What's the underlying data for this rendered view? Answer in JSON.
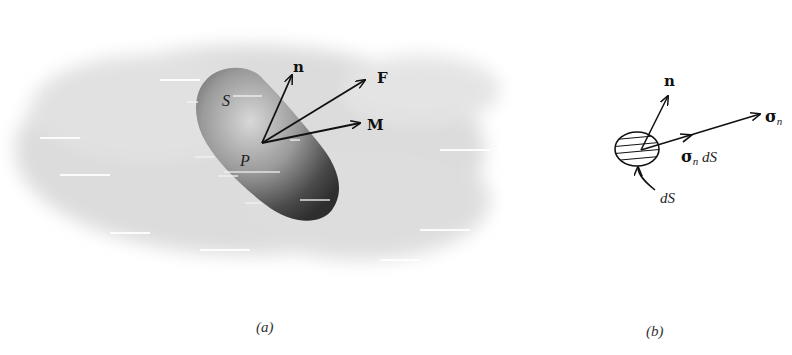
{
  "figure_a": {
    "caption": "(a)",
    "body_label": "S",
    "point_label": "P",
    "vectors": {
      "normal": "n",
      "force": "F",
      "moment": "M"
    }
  },
  "figure_b": {
    "caption": "(b)",
    "normal_label": "n",
    "stress_label": "σ",
    "stress_subscript": "n",
    "element_force_sigma": "σ",
    "element_force_sub": "n",
    "element_force_suffix": " dS",
    "area_label": "dS"
  },
  "colors": {
    "ink": "#111111",
    "shadow": "#d4d4d4",
    "body_dark": "#333333",
    "body_light": "#b8b8b8"
  }
}
